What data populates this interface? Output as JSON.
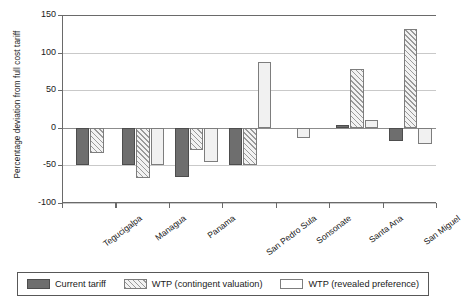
{
  "chart_data": {
    "type": "bar",
    "title": "",
    "xlabel": "",
    "ylabel": "Percentage deviation from full cost tariff",
    "ylim": [
      -100,
      150
    ],
    "yticks": [
      150,
      100,
      50,
      0,
      -50,
      -100
    ],
    "ytick_labels": [
      "150",
      "100",
      "50",
      "0",
      "-50",
      "-100"
    ],
    "grid": true,
    "legend_position": "bottom",
    "categories": [
      "Tegucigalpa",
      "Managua",
      "Panama",
      "San Pedro Sula",
      "Sonsonate",
      "Santa Ana",
      "San Miguel"
    ],
    "series": [
      {
        "name": "Current tariff",
        "color": "#6e6e6e",
        "pattern": "solid",
        "values": [
          -50,
          -50,
          -65,
          -50,
          null,
          4,
          -17
        ]
      },
      {
        "name": "WTP (contingent valuation)",
        "color": "#f2f2f2",
        "pattern": "diagonal-hatch",
        "values": [
          -33,
          -67,
          -30,
          -50,
          null,
          78,
          132
        ]
      },
      {
        "name": "WTP (revealed preference)",
        "color": "#f1f1f1",
        "pattern": "open",
        "values": [
          null,
          -50,
          -45,
          87,
          -14,
          11,
          -22
        ]
      }
    ]
  },
  "legend": {
    "items": [
      {
        "label": "Current tariff",
        "swatch": "solid-dark-swatch"
      },
      {
        "label": "WTP (contingent valuation)",
        "swatch": "hatched-swatch"
      },
      {
        "label": "WTP (revealed preference)",
        "swatch": "open-swatch"
      }
    ]
  }
}
